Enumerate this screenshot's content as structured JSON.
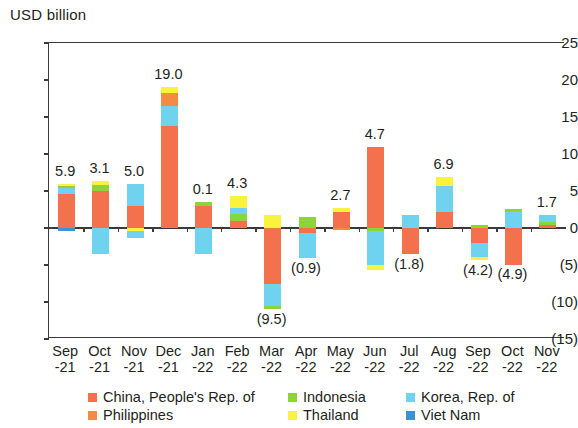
{
  "chart_data": {
    "type": "bar",
    "subtype": "stacked-bar-with-negatives",
    "title": "",
    "ylabel": "USD billion",
    "xlabel": "",
    "ylim": [
      -15,
      25
    ],
    "ytick_labels": [
      "25",
      "20",
      "15",
      "10",
      "5",
      "0",
      "(5)",
      "(10)",
      "(15)"
    ],
    "ytick_values": [
      25,
      20,
      15,
      10,
      5,
      0,
      -5,
      -10,
      -15
    ],
    "grid": false,
    "legend_position": "bottom",
    "categories": [
      "Sep\n-21",
      "Oct\n-21",
      "Nov\n-21",
      "Dec\n-21",
      "Jan\n-22",
      "Feb\n-22",
      "Mar\n-22",
      "Apr\n-22",
      "May\n-22",
      "Jun\n-22",
      "Jul\n-22",
      "Aug\n-22",
      "Sep\n-22",
      "Oct\n-22",
      "Nov\n-22"
    ],
    "category_lines": [
      [
        "Sep",
        "-21"
      ],
      [
        "Oct",
        "-21"
      ],
      [
        "Nov",
        "-21"
      ],
      [
        "Dec",
        "-21"
      ],
      [
        "Jan",
        "-22"
      ],
      [
        "Feb",
        "-22"
      ],
      [
        "Mar",
        "-22"
      ],
      [
        "Apr",
        "-22"
      ],
      [
        "May",
        "-22"
      ],
      [
        "Jun",
        "-22"
      ],
      [
        "Jul",
        "-22"
      ],
      [
        "Aug",
        "-22"
      ],
      [
        "Sep",
        "-22"
      ],
      [
        "Oct",
        "-22"
      ],
      [
        "Nov",
        "-22"
      ]
    ],
    "series": [
      {
        "name": "China, People's Rep. of",
        "color": "#f4714e",
        "values": [
          4.7,
          5.0,
          3.0,
          14.0,
          3.0,
          1.0,
          -7.5,
          -0.7,
          2.2,
          11.0,
          -3.5,
          2.2,
          -2.0,
          -4.9,
          0.5
        ]
      },
      {
        "name": "Philippines",
        "color": "#f58a42",
        "values": [
          0.0,
          0.0,
          0.0,
          1.8,
          0.0,
          0.0,
          0.0,
          0.0,
          0.0,
          0.0,
          0.0,
          0.0,
          0.0,
          0.0,
          0.0
        ]
      },
      {
        "name": "Indonesia",
        "color": "#8cd43a",
        "values": [
          0.5,
          0.9,
          0.0,
          0.0,
          0.4,
          1.0,
          0.0,
          1.5,
          0.0,
          -0.4,
          0.0,
          0.0,
          0.3,
          0.3,
          0.4
        ]
      },
      {
        "name": "Thailand",
        "color": "#faf33e",
        "values": [
          0.2,
          0.4,
          -0.4,
          0.7,
          0.0,
          1.5,
          1.7,
          0.0,
          0.5,
          -0.6,
          0.0,
          1.2,
          -0.4,
          0.0,
          0.0
        ]
      },
      {
        "name": "Korea, Rep. of",
        "color": "#6fd2ef",
        "values": [
          0.7,
          -3.4,
          3.0,
          2.5,
          -3.4,
          0.8,
          -3.2,
          -3.3,
          0.0,
          -4.5,
          1.7,
          3.5,
          -1.8,
          2.2,
          0.8
        ]
      },
      {
        "name": "Viet Nam",
        "color": "#3b93d4",
        "values": [
          -0.2,
          0.0,
          -0.8,
          0.0,
          0.0,
          0.0,
          0.0,
          0.0,
          0.0,
          0.0,
          0.0,
          0.0,
          0.0,
          0.0,
          0.0
        ]
      }
    ],
    "net_totals": [
      5.9,
      3.1,
      5.0,
      19.0,
      0.1,
      4.3,
      -9.5,
      -0.9,
      2.7,
      4.7,
      -1.8,
      6.9,
      -4.2,
      -4.9,
      1.7
    ],
    "net_total_labels": [
      "5.9",
      "3.1",
      "5.0",
      "19.0",
      "0.1",
      "4.3",
      "(9.5)",
      "(0.9)",
      "2.7",
      "4.7",
      "(1.8)",
      "6.9",
      "(4.2)",
      "(4.9)",
      "1.7"
    ],
    "stacks": [
      {
        "pos": [
          [
            "#f4714e",
            0,
            4.7
          ],
          [
            "#6fd2ef",
            4.7,
            5.4
          ],
          [
            "#8cd43a",
            5.4,
            5.75
          ],
          [
            "#faf33e",
            5.75,
            5.95
          ]
        ],
        "neg": [
          [
            "#3b93d4",
            0,
            -0.35
          ]
        ]
      },
      {
        "pos": [
          [
            "#f4714e",
            0,
            5.0
          ],
          [
            "#8cd43a",
            5.0,
            5.9
          ],
          [
            "#faf33e",
            5.9,
            6.35
          ]
        ],
        "neg": [
          [
            "#6fd2ef",
            0,
            -3.4
          ]
        ]
      },
      {
        "pos": [
          [
            "#f4714e",
            0,
            3.0
          ],
          [
            "#6fd2ef",
            3.0,
            6.0
          ]
        ],
        "neg": [
          [
            "#faf33e",
            0,
            -0.45
          ],
          [
            "#6fd2ef",
            -0.45,
            -1.25
          ]
        ]
      },
      {
        "pos": [
          [
            "#f4714e",
            0,
            13.9
          ],
          [
            "#6fd2ef",
            13.9,
            16.5
          ],
          [
            "#f58a42",
            16.5,
            18.3
          ],
          [
            "#faf33e",
            18.3,
            19.0
          ]
        ],
        "neg": []
      },
      {
        "pos": [
          [
            "#f4714e",
            0,
            3.0
          ],
          [
            "#8cd43a",
            3.0,
            3.45
          ]
        ],
        "neg": [
          [
            "#6fd2ef",
            0,
            -3.4
          ]
        ]
      },
      {
        "pos": [
          [
            "#f4714e",
            0,
            1.0
          ],
          [
            "#8cd43a",
            1.0,
            2.0
          ],
          [
            "#6fd2ef",
            2.0,
            2.8
          ],
          [
            "#faf33e",
            2.8,
            4.35
          ]
        ],
        "neg": []
      },
      {
        "pos": [
          [
            "#faf33e",
            0,
            1.7
          ]
        ],
        "neg": [
          [
            "#f4714e",
            0,
            -7.5
          ],
          [
            "#6fd2ef",
            -7.5,
            -10.6
          ],
          [
            "#8cd43a",
            -10.6,
            -10.9
          ]
        ]
      },
      {
        "pos": [
          [
            "#8cd43a",
            0,
            1.55
          ]
        ],
        "neg": [
          [
            "#f4714e",
            0,
            -0.7
          ],
          [
            "#6fd2ef",
            -0.7,
            -4.0
          ]
        ]
      },
      {
        "pos": [
          [
            "#f4714e",
            0,
            2.2
          ],
          [
            "#faf33e",
            2.2,
            2.75
          ]
        ],
        "neg": [
          [
            "#f58a42",
            0,
            -0.15
          ]
        ]
      },
      {
        "pos": [
          [
            "#f4714e",
            0,
            11.0
          ]
        ],
        "neg": [
          [
            "#8cd43a",
            0,
            -0.4
          ],
          [
            "#6fd2ef",
            -0.4,
            -5.0
          ],
          [
            "#faf33e",
            -5.0,
            -5.6
          ]
        ]
      },
      {
        "pos": [
          [
            "#6fd2ef",
            0,
            1.7
          ]
        ],
        "neg": [
          [
            "#f4714e",
            0,
            -3.5
          ]
        ]
      },
      {
        "pos": [
          [
            "#f4714e",
            0,
            2.2
          ],
          [
            "#6fd2ef",
            2.2,
            5.7
          ],
          [
            "#faf33e",
            5.7,
            6.9
          ]
        ],
        "neg": []
      },
      {
        "pos": [
          [
            "#8cd43a",
            0,
            0.35
          ]
        ],
        "neg": [
          [
            "#f4714e",
            0,
            -2.0
          ],
          [
            "#6fd2ef",
            -2.0,
            -3.9
          ],
          [
            "#faf33e",
            -3.9,
            -4.3
          ]
        ]
      },
      {
        "pos": [
          [
            "#6fd2ef",
            0,
            2.2
          ],
          [
            "#8cd43a",
            2.2,
            2.6
          ]
        ],
        "neg": [
          [
            "#f4714e",
            0,
            -4.9
          ]
        ]
      },
      {
        "pos": [
          [
            "#f4714e",
            0,
            0.5
          ],
          [
            "#8cd43a",
            0.5,
            0.9
          ],
          [
            "#6fd2ef",
            0.9,
            1.7
          ]
        ],
        "neg": []
      }
    ]
  },
  "legend": {
    "items": [
      {
        "label": "China, People's Rep. of",
        "color": "#f4714e"
      },
      {
        "label": "Indonesia",
        "color": "#8cd43a"
      },
      {
        "label": "Korea, Rep. of",
        "color": "#6fd2ef"
      },
      {
        "label": "Philippines",
        "color": "#f58a42"
      },
      {
        "label": "Thailand",
        "color": "#faf33e"
      },
      {
        "label": "Viet Nam",
        "color": "#3b93d4"
      }
    ]
  }
}
